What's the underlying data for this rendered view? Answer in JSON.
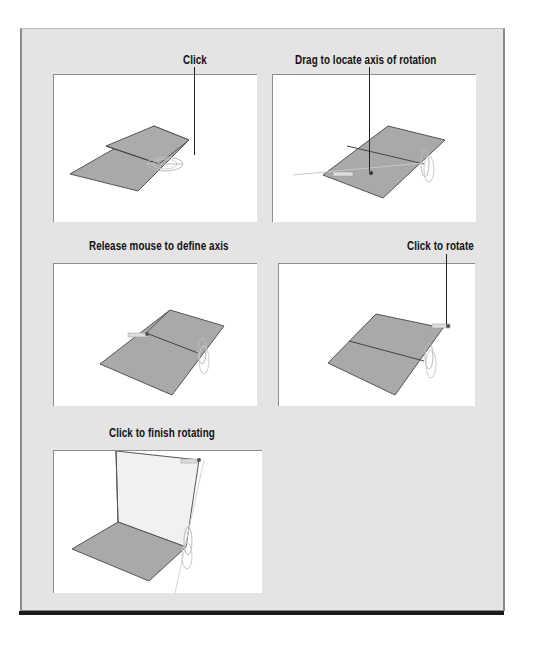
{
  "figure": {
    "background": "#e4e4e4",
    "panel_background": "#ffffff",
    "surface_color": "#a9a9a9",
    "panels": [
      {
        "id": "p1",
        "caption": "Click",
        "step": "click-start"
      },
      {
        "id": "p2",
        "caption": "Drag to locate axis of rotation",
        "step": "drag-axis"
      },
      {
        "id": "p3",
        "caption": "Release mouse to define axis",
        "step": "release-axis"
      },
      {
        "id": "p4",
        "caption": "Click to rotate",
        "step": "click-rotate"
      },
      {
        "id": "p5",
        "caption": "Click to finish rotating",
        "step": "finish-rotate"
      }
    ]
  }
}
